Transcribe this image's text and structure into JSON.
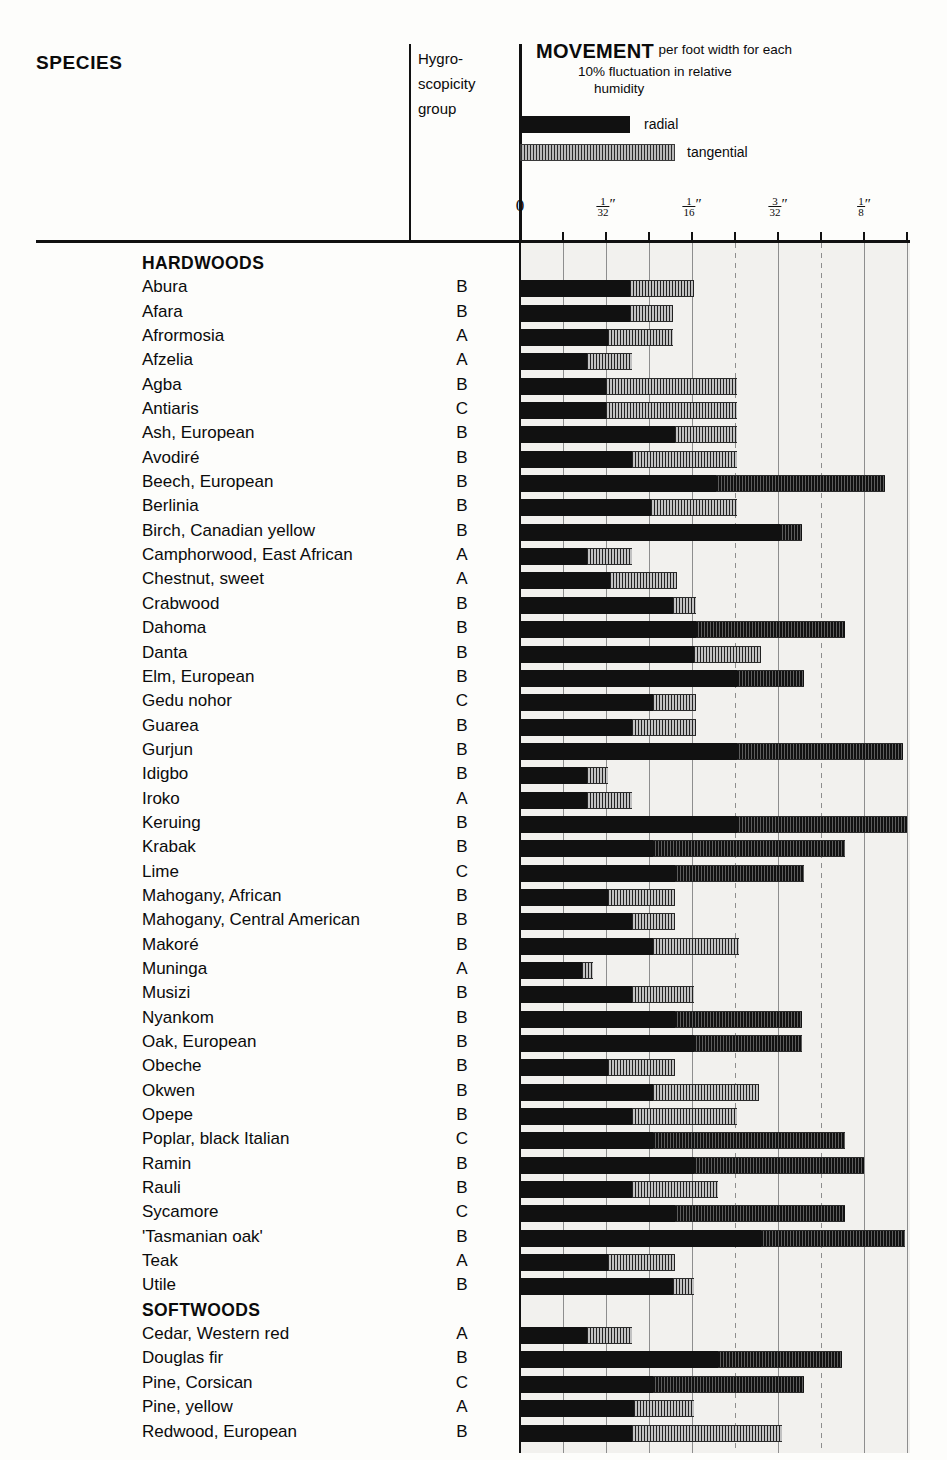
{
  "header": {
    "species_label": "SPECIES",
    "hygro_label_line1": "Hygro-",
    "hygro_label_line2": "scopicity",
    "hygro_label_line3": "group",
    "movement_title": "MOVEMENT",
    "movement_sub1": "per foot width for each",
    "movement_sub2": "10% fluctuation in relative",
    "movement_sub3": "humidity",
    "key_radial": "radial",
    "key_tangential": "tangential"
  },
  "axis": {
    "zero_label": "0",
    "ticks": [
      {
        "label_num": "",
        "label_den": "",
        "plain": "0",
        "pos": 520
      },
      {
        "pos": 563
      },
      {
        "label_num": "1",
        "label_den": "32",
        "pos": 606
      },
      {
        "pos": 649
      },
      {
        "label_num": "1",
        "label_den": "16",
        "pos": 692
      },
      {
        "pos": 735
      },
      {
        "label_num": "3",
        "label_den": "32",
        "pos": 778
      },
      {
        "pos": 821
      },
      {
        "label_num": "1",
        "label_den": "8",
        "pos": 864
      },
      {
        "pos": 907
      }
    ],
    "unit_symbol": "″",
    "units_label": "inches per foot width",
    "px_per_64th": 43,
    "origin_px": 520
  },
  "group_labels": {
    "hardwoods": "HARDWOODS",
    "softwoods": "SOFTWOODS"
  },
  "chart_data": {
    "type": "bar",
    "orientation": "horizontal",
    "title": "MOVEMENT per foot width for each 10% fluctuation in relative humidity",
    "xlabel": "Movement (inches)",
    "ylabel": "Species",
    "xlim": [
      0,
      0.1406
    ],
    "xticks": [
      0,
      0.03125,
      0.0625,
      0.09375,
      0.125
    ],
    "xticklabels": [
      "0",
      "1/32″",
      "1/16″",
      "3/32″",
      "1/8″"
    ],
    "grid": true,
    "legend": [
      "radial",
      "tangential"
    ],
    "legend_position": "top",
    "series": [
      {
        "name": "radial",
        "unit": "inch per foot width"
      },
      {
        "name": "tangential",
        "unit": "inch per foot width"
      }
    ],
    "columns": [
      "species",
      "hygroscopicity_group",
      "radial",
      "tangential"
    ],
    "note": "radial & tangential values expressed in 64ths of an inch",
    "rows": [
      {
        "group": "HARDWOODS"
      },
      {
        "species": "Abura",
        "hygro": "B",
        "radial_64ths": 2.55,
        "tangential_64ths": 4.05
      },
      {
        "species": "Afara",
        "hygro": "B",
        "radial_64ths": 2.55,
        "tangential_64ths": 3.55
      },
      {
        "species": "Afrormosia",
        "hygro": "A",
        "radial_64ths": 2.05,
        "tangential_64ths": 3.55
      },
      {
        "species": "Afzelia",
        "hygro": "A",
        "radial_64ths": 1.55,
        "tangential_64ths": 2.6
      },
      {
        "species": "Agba",
        "hygro": "B",
        "radial_64ths": 2.0,
        "tangential_64ths": 5.05
      },
      {
        "species": "Antiaris",
        "hygro": "C",
        "radial_64ths": 2.0,
        "tangential_64ths": 5.05
      },
      {
        "species": "Ash, European",
        "hygro": "B",
        "radial_64ths": 3.6,
        "tangential_64ths": 5.05
      },
      {
        "species": "Avodiré",
        "hygro": "B",
        "radial_64ths": 2.6,
        "tangential_64ths": 5.05
      },
      {
        "species": "Beech, European",
        "hygro": "B",
        "radial_64ths": 4.55,
        "tangential_64ths": 8.5
      },
      {
        "species": "Berlinia",
        "hygro": "B",
        "radial_64ths": 3.05,
        "tangential_64ths": 5.05
      },
      {
        "species": "Birch, Canadian yellow",
        "hygro": "B",
        "radial_64ths": 6.05,
        "tangential_64ths": 6.55
      },
      {
        "species": "Camphorwood, East African",
        "hygro": "A",
        "radial_64ths": 1.55,
        "tangential_64ths": 2.6
      },
      {
        "species": "Chestnut, sweet",
        "hygro": "A",
        "radial_64ths": 2.1,
        "tangential_64ths": 3.65
      },
      {
        "species": "Crabwood",
        "hygro": "B",
        "radial_64ths": 3.55,
        "tangential_64ths": 4.1
      },
      {
        "species": "Dahoma",
        "hygro": "B",
        "radial_64ths": 4.1,
        "tangential_64ths": 7.55
      },
      {
        "species": "Danta",
        "hygro": "B",
        "radial_64ths": 4.05,
        "tangential_64ths": 5.6
      },
      {
        "species": "Elm, European",
        "hygro": "B",
        "radial_64ths": 5.05,
        "tangential_64ths": 6.6
      },
      {
        "species": "Gedu nohor",
        "hygro": "C",
        "radial_64ths": 3.1,
        "tangential_64ths": 4.1
      },
      {
        "species": "Guarea",
        "hygro": "B",
        "radial_64ths": 2.6,
        "tangential_64ths": 4.1
      },
      {
        "species": "Gurjun",
        "hygro": "B",
        "radial_64ths": 5.05,
        "tangential_64ths": 8.9
      },
      {
        "species": "Idigbo",
        "hygro": "B",
        "radial_64ths": 1.55,
        "tangential_64ths": 2.05
      },
      {
        "species": "Iroko",
        "hygro": "A",
        "radial_64ths": 1.55,
        "tangential_64ths": 2.6
      },
      {
        "species": "Keruing",
        "hygro": "B",
        "radial_64ths": 5.05,
        "tangential_64ths": 9.0
      },
      {
        "species": "Krabak",
        "hygro": "B",
        "radial_64ths": 3.1,
        "tangential_64ths": 7.55
      },
      {
        "species": "Lime",
        "hygro": "C",
        "radial_64ths": 3.6,
        "tangential_64ths": 6.6
      },
      {
        "species": "Mahogany, African",
        "hygro": "B",
        "radial_64ths": 2.05,
        "tangential_64ths": 3.6
      },
      {
        "species": "Mahogany, Central American",
        "hygro": "B",
        "radial_64ths": 2.6,
        "tangential_64ths": 3.6
      },
      {
        "species": "Makoré",
        "hygro": "B",
        "radial_64ths": 3.1,
        "tangential_64ths": 5.1
      },
      {
        "species": "Muninga",
        "hygro": "A",
        "radial_64ths": 1.45,
        "tangential_64ths": 1.7
      },
      {
        "species": "Musizi",
        "hygro": "B",
        "radial_64ths": 2.6,
        "tangential_64ths": 4.05
      },
      {
        "species": "Nyankom",
        "hygro": "B",
        "radial_64ths": 3.6,
        "tangential_64ths": 6.55
      },
      {
        "species": "Oak, European",
        "hygro": "B",
        "radial_64ths": 4.05,
        "tangential_64ths": 6.55
      },
      {
        "species": "Obeche",
        "hygro": "B",
        "radial_64ths": 2.05,
        "tangential_64ths": 3.6
      },
      {
        "species": "Okwen",
        "hygro": "B",
        "radial_64ths": 3.1,
        "tangential_64ths": 5.55
      },
      {
        "species": "Opepe",
        "hygro": "B",
        "radial_64ths": 2.6,
        "tangential_64ths": 5.05
      },
      {
        "species": "Poplar, black Italian",
        "hygro": "C",
        "radial_64ths": 3.1,
        "tangential_64ths": 7.55
      },
      {
        "species": "Ramin",
        "hygro": "B",
        "radial_64ths": 4.05,
        "tangential_64ths": 8.0
      },
      {
        "species": "Rauli",
        "hygro": "B",
        "radial_64ths": 2.6,
        "tangential_64ths": 4.6
      },
      {
        "species": "Sycamore",
        "hygro": "C",
        "radial_64ths": 3.6,
        "tangential_64ths": 7.55
      },
      {
        "species": "'Tasmanian oak'",
        "hygro": "B",
        "radial_64ths": 5.6,
        "tangential_64ths": 8.95
      },
      {
        "species": "Teak",
        "hygro": "A",
        "radial_64ths": 2.05,
        "tangential_64ths": 3.6
      },
      {
        "species": "Utile",
        "hygro": "B",
        "radial_64ths": 3.55,
        "tangential_64ths": 4.05
      },
      {
        "group": "SOFTWOODS"
      },
      {
        "species": "Cedar, Western red",
        "hygro": "A",
        "radial_64ths": 1.55,
        "tangential_64ths": 2.6
      },
      {
        "species": "Douglas fir",
        "hygro": "B",
        "radial_64ths": 4.6,
        "tangential_64ths": 7.5
      },
      {
        "species": "Pine, Corsican",
        "hygro": "C",
        "radial_64ths": 3.1,
        "tangential_64ths": 6.6
      },
      {
        "species": "Pine, yellow",
        "hygro": "A",
        "radial_64ths": 2.65,
        "tangential_64ths": 4.05
      },
      {
        "species": "Redwood, European",
        "hygro": "B",
        "radial_64ths": 2.6,
        "tangential_64ths": 6.1
      }
    ]
  }
}
